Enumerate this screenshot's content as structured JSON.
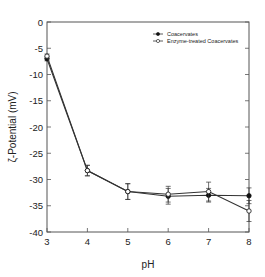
{
  "chart_data": {
    "type": "line",
    "title": "",
    "xlabel": "pH",
    "ylabel": "ζ-Potential (mV)",
    "x": [
      3,
      4,
      5,
      6,
      7,
      8
    ],
    "xlim": [
      3,
      8
    ],
    "ylim": [
      -40,
      0
    ],
    "xticks": [
      "3",
      "4",
      "5",
      "6",
      "7",
      "8"
    ],
    "yticks": [
      "0",
      "-5",
      "-10",
      "-15",
      "-20",
      "-25",
      "-30",
      "-35",
      "-40"
    ],
    "grid": false,
    "legend_position": "upper right",
    "series": [
      {
        "name": "Coacervates",
        "marker": "filled-circle",
        "values": [
          -7.0,
          -28.3,
          -32.3,
          -33.2,
          -33.0,
          -33.1
        ],
        "errors": [
          0.4,
          1.0,
          1.5,
          1.5,
          1.3,
          1.5
        ]
      },
      {
        "name": "Enzyme-treated Coacervates",
        "marker": "open-circle",
        "values": [
          -6.5,
          -28.3,
          -32.3,
          -32.8,
          -32.3,
          -36.0
        ],
        "errors": [
          0.4,
          1.0,
          1.5,
          1.5,
          1.8,
          2.0
        ]
      }
    ]
  },
  "legend": {
    "items": [
      "Coacervates",
      "Enzyme-treated Coacervates"
    ]
  },
  "axes": {
    "xlabel": "pH",
    "ylabel": "ζ-Potential (mV)"
  }
}
